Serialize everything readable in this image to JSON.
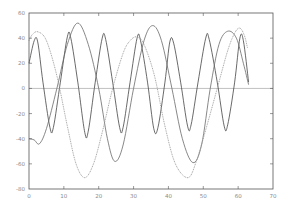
{
  "chart_data": {
    "type": "line",
    "title": "",
    "xlabel": "",
    "ylabel": "",
    "xlim": [
      0,
      70
    ],
    "ylim": [
      -80,
      60
    ],
    "xticks": [
      0,
      10,
      20,
      30,
      40,
      50,
      60,
      70
    ],
    "yticks": [
      -80,
      -60,
      -40,
      -20,
      0,
      20,
      40,
      60
    ],
    "grid": false,
    "legend": null,
    "zero_line": true,
    "series": [
      {
        "name": "series-dark",
        "color": "#444444",
        "style": "solid",
        "x": [
          0,
          1.5,
          2.5,
          4,
          6,
          7,
          9,
          11,
          12,
          14,
          16,
          17,
          19,
          21,
          22,
          24,
          26,
          27,
          29,
          31,
          32,
          34,
          35.8,
          37,
          39,
          40.4,
          41.5,
          43.5,
          45.5,
          46.5,
          48.5,
          50.7,
          51.7,
          54,
          56,
          57,
          59,
          60.5,
          61.5,
          63
        ],
        "y": [
          20,
          38,
          37,
          5,
          -31,
          -31,
          5,
          41,
          40,
          5,
          -35,
          -34,
          5,
          40,
          39,
          5,
          -31,
          -31,
          5,
          40,
          38,
          5,
          -32,
          -31,
          5,
          37,
          36,
          5,
          -30,
          -29,
          5,
          40,
          39,
          5,
          -30,
          -29,
          5,
          40,
          38,
          5
        ]
      },
      {
        "name": "series-medium",
        "color": "#6a6a6a",
        "style": "solid",
        "x": [
          0,
          1.5,
          3,
          5,
          8,
          11,
          14,
          17,
          20,
          22.5,
          24.6,
          27,
          30,
          33,
          35.5,
          38,
          41,
          44,
          47,
          49.5,
          52,
          54.5,
          57,
          59.5,
          61.5,
          63
        ],
        "y": [
          -40,
          -41,
          -44,
          -32,
          0,
          35,
          52,
          35,
          0,
          -40,
          -58,
          -45,
          0,
          38,
          50,
          38,
          0,
          -40,
          -59,
          -45,
          0,
          35,
          45.5,
          40,
          20,
          3
        ]
      },
      {
        "name": "series-light",
        "color": "#9a9a9a",
        "style": "dotted",
        "x": [
          0,
          1,
          2.6,
          5,
          8,
          11,
          13.5,
          16,
          18.5,
          21,
          24,
          27,
          29,
          31,
          33,
          36,
          39,
          42,
          45.6,
          48,
          51,
          54,
          57,
          59,
          60.5,
          61.8,
          62.7
        ],
        "y": [
          38,
          43,
          45,
          38,
          10,
          -30,
          -60,
          -71,
          -60,
          -35,
          0,
          28,
          38,
          41,
          35,
          10,
          -30,
          -60,
          -71,
          -58,
          -30,
          0,
          30,
          44,
          48,
          42,
          32
        ]
      }
    ]
  },
  "axes": {
    "x_tick_labels": [
      "0",
      "10",
      "20",
      "30",
      "40",
      "50",
      "60",
      "70"
    ],
    "y_tick_labels": [
      "-80",
      "-60",
      "-40",
      "-20",
      "0",
      "20",
      "40",
      "60"
    ],
    "axis_color": "#555555",
    "zero_line_color": "#b0b0b0"
  }
}
